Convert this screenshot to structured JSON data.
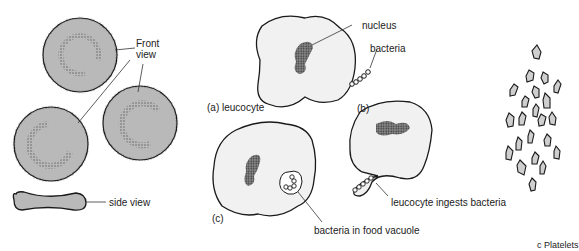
{
  "red_blood_cells": {
    "front_view_label_line1": "Front",
    "front_view_label_line2": "view",
    "side_view_label": "side view"
  },
  "white_blood_cells": {
    "nucleus_label": "nucleus",
    "bacteria_label": "bacteria",
    "stage_a_label": "(a) leucocyte",
    "stage_b_label": "(b)",
    "stage_c_label": "(c)",
    "ingests_label": "leucocyte ingests bacteria",
    "vacuole_label": "bacteria in food vacuole"
  },
  "platelets": {
    "caption_partial": "c Platelets"
  },
  "colors": {
    "rbc_fill": "#b9b9b9",
    "wbc_fill": "#f1f1f1",
    "nucleus_fill": "#6e6e6e",
    "platelet_fill": "#cfcfcf",
    "outline": "#1a1a1a"
  }
}
